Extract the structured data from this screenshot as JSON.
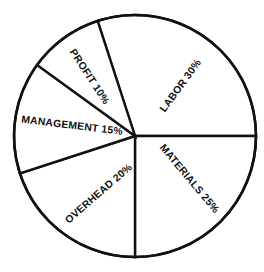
{
  "chart_data": {
    "type": "pie",
    "title": "",
    "subtitle": "",
    "xlabel": "",
    "ylabel": "",
    "legend": "none",
    "grid": false,
    "labels_inside_slices": true,
    "start_angle_deg": 0,
    "direction": "counterclockwise",
    "categories": [
      "LABOR",
      "MATERIALS",
      "OVERHEAD",
      "MANAGEMENT",
      "PROFIT"
    ],
    "values": [
      30,
      25,
      20,
      15,
      10
    ],
    "units": "percent",
    "total": 100,
    "slices": [
      {
        "name": "LABOR",
        "value": 30,
        "label": "LABOR 30%",
        "start_deg": 0,
        "end_deg": 108,
        "label_x": 181,
        "label_y": 86,
        "label_rotation_deg": -54,
        "fill": "#ffffff",
        "stroke": "#111111"
      },
      {
        "name": "MATERIALS",
        "value": 25,
        "label": "MATERIALS 25%",
        "start_deg": 270,
        "end_deg": 360,
        "label_x": 189,
        "label_y": 179,
        "label_rotation_deg": 50,
        "fill": "#ffffff",
        "stroke": "#111111"
      },
      {
        "name": "OVERHEAD",
        "value": 20,
        "label": "OVERHEAD 20%",
        "start_deg": 198,
        "end_deg": 270,
        "label_x": 99,
        "label_y": 194,
        "label_rotation_deg": -41,
        "fill": "#ffffff",
        "stroke": "#111111"
      },
      {
        "name": "MANAGEMENT",
        "value": 15,
        "label": "MANAGEMENT 15%",
        "start_deg": 144,
        "end_deg": 198,
        "label_x": 72,
        "label_y": 126,
        "label_rotation_deg": 7,
        "fill": "#ffffff",
        "stroke": "#111111"
      },
      {
        "name": "PROFIT",
        "value": 10,
        "label": "PROFIT 10%",
        "start_deg": 108,
        "end_deg": 144,
        "label_x": 89,
        "label_y": 77,
        "label_rotation_deg": 57,
        "fill": "#ffffff",
        "stroke": "#111111"
      }
    ],
    "geometry": {
      "center_x": 135,
      "center_y": 136,
      "radius": 121,
      "stroke_color": "#111111",
      "stroke_width": 2.4,
      "background": "#ffffff"
    }
  }
}
